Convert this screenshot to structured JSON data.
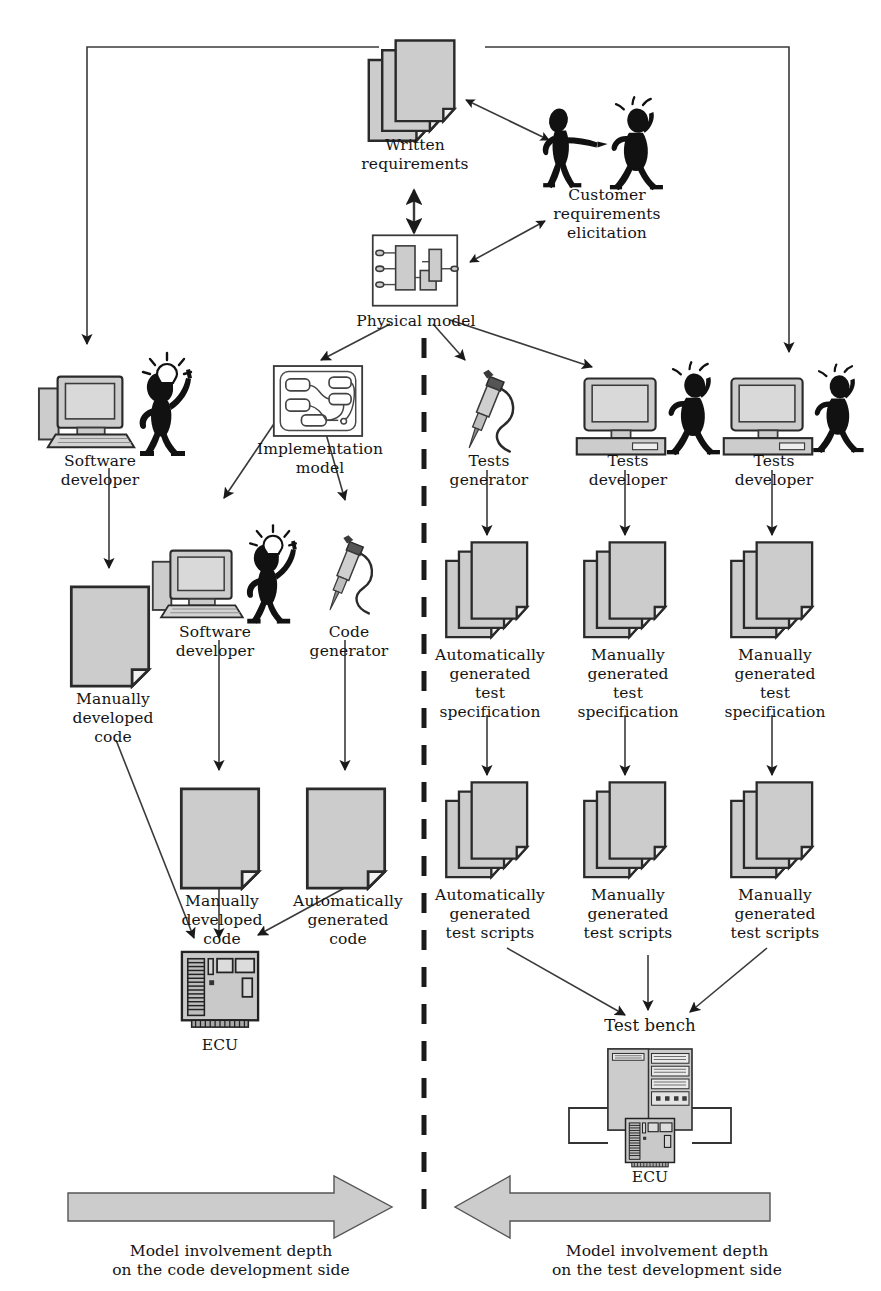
{
  "diagram": {
    "colors": {
      "fill_gray": "#cccccc",
      "fill_gray_light": "#d4d4d4",
      "line_dark": "#1a1a1a",
      "line_thin": "#555555",
      "arrow_block_fill": "#cccccc",
      "background": "#ffffff"
    },
    "nodes": [
      {
        "id": "written-requirements",
        "label": "Written\nrequirements",
        "icon": "document-stack-icon"
      },
      {
        "id": "customer-requirements",
        "label": "Customer\nrequirements\nelicitation",
        "icon": "two-people-icon"
      },
      {
        "id": "physical-model",
        "label": "Physical model",
        "icon": "block-diagram-icon"
      },
      {
        "id": "software-developer-left",
        "label": "Software\ndeveloper",
        "icon": "desktop-computer-with-person-icon"
      },
      {
        "id": "implementation-model",
        "label": "Implementation\nmodel",
        "icon": "implementation-model-icon"
      },
      {
        "id": "tests-generator",
        "label": "Tests\ngenerator",
        "icon": "probe-tool-icon"
      },
      {
        "id": "tests-developer-middle",
        "label": "Tests\ndeveloper",
        "icon": "monitor-with-person-icon"
      },
      {
        "id": "tests-developer-right",
        "label": "Tests\ndeveloper",
        "icon": "monitor-with-person-icon"
      },
      {
        "id": "software-developer-mid",
        "label": "Software\ndeveloper",
        "icon": "desktop-computer-with-person-icon"
      },
      {
        "id": "code-generator",
        "label": "Code\ngenerator",
        "icon": "probe-tool-icon"
      },
      {
        "id": "manually-developed-code-left",
        "label": "Manually\ndeveloped\ncode",
        "icon": "document-icon"
      },
      {
        "id": "manually-developed-code-mid",
        "label": "Manually\ndeveloped\ncode",
        "icon": "document-icon"
      },
      {
        "id": "automatically-generated-code",
        "label": "Automatically\ngenerated\ncode",
        "icon": "document-icon"
      },
      {
        "id": "auto-test-spec",
        "label": "Automatically\ngenerated\ntest\nspecification",
        "icon": "document-stack-icon"
      },
      {
        "id": "manual-test-spec-1",
        "label": "Manually\ngenerated\ntest\nspecification",
        "icon": "document-stack-icon"
      },
      {
        "id": "manual-test-spec-2",
        "label": "Manually\ngenerated\ntest\nspecification",
        "icon": "document-stack-icon"
      },
      {
        "id": "auto-test-scripts",
        "label": "Automatically\ngenerated\ntest scripts",
        "icon": "document-stack-icon"
      },
      {
        "id": "manual-test-scripts-1",
        "label": "Manually\ngenerated\ntest scripts",
        "icon": "document-stack-icon"
      },
      {
        "id": "manual-test-scripts-2",
        "label": "Manually\ngenerated\ntest scripts",
        "icon": "document-stack-icon"
      },
      {
        "id": "ecu-left",
        "label": "ECU",
        "icon": "circuit-board-icon"
      },
      {
        "id": "test-bench",
        "label": "Test bench",
        "icon": "rack-cabinet-icon"
      },
      {
        "id": "ecu-bench",
        "label": "ECU",
        "icon": "circuit-board-icon"
      }
    ],
    "bottom_arrows": [
      {
        "id": "code-side-arrow",
        "direction": "right",
        "caption": "Model involvement depth\non the code development side"
      },
      {
        "id": "test-side-arrow",
        "direction": "left",
        "caption": "Model involvement depth\non the test development side"
      }
    ],
    "divider": {
      "id": "vertical-dashed-divider",
      "style": "dashed"
    }
  }
}
